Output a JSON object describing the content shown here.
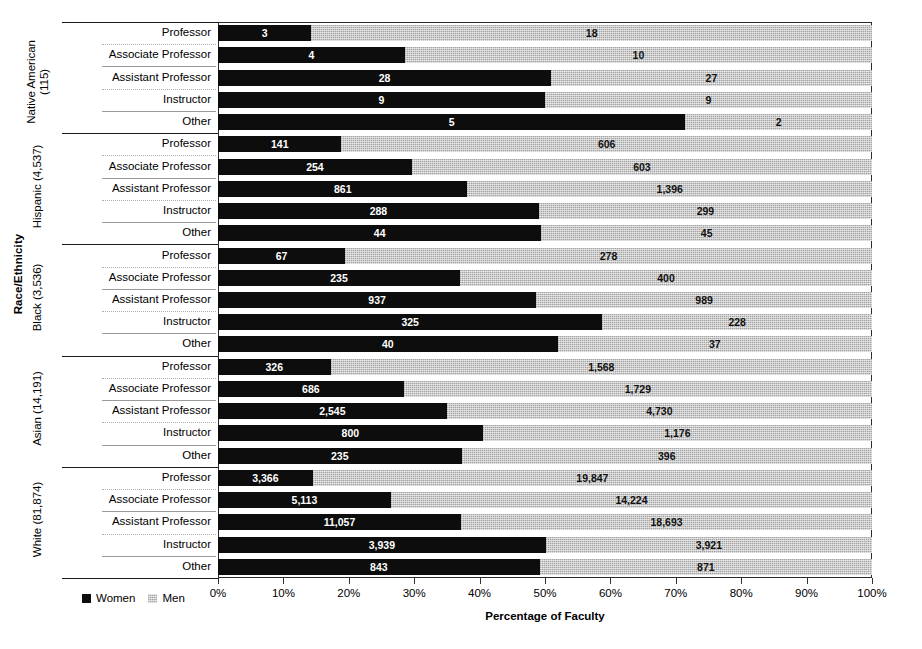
{
  "chart_data": {
    "type": "bar",
    "subtype": "stacked-horizontal-100pct",
    "title": "",
    "xlabel": "Percentage of Faculty",
    "ylabel": "Race/Ethnicity",
    "xlim": [
      0,
      100
    ],
    "grid": false,
    "legend_position": "bottom-left",
    "xtick_labels": [
      "0%",
      "10%",
      "20%",
      "30%",
      "40%",
      "50%",
      "60%",
      "70%",
      "80%",
      "90%",
      "100%"
    ],
    "xtick_values": [
      0,
      10,
      20,
      30,
      40,
      50,
      60,
      70,
      80,
      90,
      100
    ],
    "series": [
      {
        "name": "Women",
        "color": "#0d0d0d"
      },
      {
        "name": "Men",
        "color": "#c9c9c9"
      }
    ],
    "categories": [
      "Professor",
      "Associate Professor",
      "Assistant Professor",
      "Instructor",
      "Other"
    ],
    "groups": [
      {
        "name": "Native American",
        "total": "115",
        "label": "Native American (115)",
        "label_line1": "Native American",
        "label_line2": "(115)",
        "rows": [
          {
            "category": "Professor",
            "women": 3,
            "men": 18,
            "women_label": "3",
            "men_label": "18"
          },
          {
            "category": "Associate Professor",
            "women": 4,
            "men": 10,
            "women_label": "4",
            "men_label": "10"
          },
          {
            "category": "Assistant Professor",
            "women": 28,
            "men": 27,
            "women_label": "28",
            "men_label": "27"
          },
          {
            "category": "Instructor",
            "women": 9,
            "men": 9,
            "women_label": "9",
            "men_label": "9"
          },
          {
            "category": "Other",
            "women": 5,
            "men": 2,
            "women_label": "5",
            "men_label": "2"
          }
        ]
      },
      {
        "name": "Hispanic",
        "total": "4,537",
        "label": "Hispanic (4,537)",
        "label_line1": "Hispanic (4,537)",
        "label_line2": "",
        "rows": [
          {
            "category": "Professor",
            "women": 141,
            "men": 606,
            "women_label": "141",
            "men_label": "606"
          },
          {
            "category": "Associate Professor",
            "women": 254,
            "men": 603,
            "women_label": "254",
            "men_label": "603"
          },
          {
            "category": "Assistant Professor",
            "women": 861,
            "men": 1396,
            "women_label": "861",
            "men_label": "1,396"
          },
          {
            "category": "Instructor",
            "women": 288,
            "men": 299,
            "women_label": "288",
            "men_label": "299"
          },
          {
            "category": "Other",
            "women": 44,
            "men": 45,
            "women_label": "44",
            "men_label": "45"
          }
        ]
      },
      {
        "name": "Black",
        "total": "3,536",
        "label": "Black (3,536)",
        "label_line1": "Black (3,536)",
        "label_line2": "",
        "rows": [
          {
            "category": "Professor",
            "women": 67,
            "men": 278,
            "women_label": "67",
            "men_label": "278"
          },
          {
            "category": "Associate Professor",
            "women": 235,
            "men": 400,
            "women_label": "235",
            "men_label": "400"
          },
          {
            "category": "Assistant Professor",
            "women": 937,
            "men": 989,
            "women_label": "937",
            "men_label": "989"
          },
          {
            "category": "Instructor",
            "women": 325,
            "men": 228,
            "women_label": "325",
            "men_label": "228"
          },
          {
            "category": "Other",
            "women": 40,
            "men": 37,
            "women_label": "40",
            "men_label": "37"
          }
        ]
      },
      {
        "name": "Asian",
        "total": "14,191",
        "label": "Asian (14,191)",
        "label_line1": "Asian (14,191)",
        "label_line2": "",
        "rows": [
          {
            "category": "Professor",
            "women": 326,
            "men": 1568,
            "women_label": "326",
            "men_label": "1,568"
          },
          {
            "category": "Associate Professor",
            "women": 686,
            "men": 1729,
            "women_label": "686",
            "men_label": "1,729"
          },
          {
            "category": "Assistant Professor",
            "women": 2545,
            "men": 4730,
            "women_label": "2,545",
            "men_label": "4,730"
          },
          {
            "category": "Instructor",
            "women": 800,
            "men": 1176,
            "women_label": "800",
            "men_label": "1,176"
          },
          {
            "category": "Other",
            "women": 235,
            "men": 396,
            "women_label": "235",
            "men_label": "396"
          }
        ]
      },
      {
        "name": "White",
        "total": "81,874",
        "label": "White (81,874)",
        "label_line1": "White (81,874)",
        "label_line2": "",
        "rows": [
          {
            "category": "Professor",
            "women": 3366,
            "men": 19847,
            "women_label": "3,366",
            "men_label": "19,847"
          },
          {
            "category": "Associate Professor",
            "women": 5113,
            "men": 14224,
            "women_label": "5,113",
            "men_label": "14,224"
          },
          {
            "category": "Assistant Professor",
            "women": 11057,
            "men": 18693,
            "women_label": "11,057",
            "men_label": "18,693"
          },
          {
            "category": "Instructor",
            "women": 3939,
            "men": 3921,
            "women_label": "3,939",
            "men_label": "3,921"
          },
          {
            "category": "Other",
            "women": 843,
            "men": 871,
            "women_label": "843",
            "men_label": "871"
          }
        ]
      }
    ]
  }
}
